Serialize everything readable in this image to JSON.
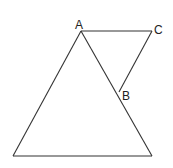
{
  "diagram": {
    "labels": {
      "A": "A",
      "B": "B",
      "C": "C"
    },
    "points": {
      "A": [
        81,
        31
      ],
      "B": [
        119,
        92
      ],
      "C": [
        152,
        31
      ],
      "BL": [
        13,
        156
      ],
      "BR": [
        152,
        156
      ]
    },
    "segments": [
      [
        "A",
        "BL"
      ],
      [
        "A",
        "BR"
      ],
      [
        "BL",
        "BR"
      ],
      [
        "A",
        "C"
      ],
      [
        "C",
        "B"
      ]
    ],
    "stroke_color": "#333333",
    "background": "#ffffff"
  }
}
